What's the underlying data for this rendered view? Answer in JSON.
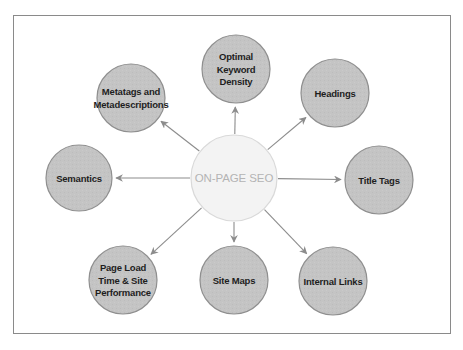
{
  "diagram": {
    "title": "ON-PAGE SEO",
    "center": {
      "label": "ON-PAGE SEO",
      "fill": "#f3f3f3",
      "stroke": "#d9d9d9",
      "text_color": "#b4b4b4"
    },
    "node_style": {
      "fill": "#c4c4c4",
      "stroke": "#8f8f8f",
      "text_color": "#1e1e1e"
    },
    "arrow_color": "#8c8c8c",
    "frame_color": "#8a8a8a",
    "nodes": [
      {
        "id": "optimal-keyword-density",
        "lines": [
          "Optimal",
          "Keyword",
          "Density"
        ],
        "direction": "top"
      },
      {
        "id": "headings",
        "lines": [
          "Headings"
        ],
        "direction": "top-right"
      },
      {
        "id": "title-tags",
        "lines": [
          "Title Tags"
        ],
        "direction": "right"
      },
      {
        "id": "internal-links",
        "lines": [
          "Internal Links"
        ],
        "direction": "bottom-right"
      },
      {
        "id": "site-maps",
        "lines": [
          "Site Maps"
        ],
        "direction": "bottom"
      },
      {
        "id": "page-load-time",
        "lines": [
          "Page Load",
          "Time & Site",
          "Performance"
        ],
        "direction": "bottom-left"
      },
      {
        "id": "semantics",
        "lines": [
          "Semantics"
        ],
        "direction": "left"
      },
      {
        "id": "metatags",
        "lines": [
          "Metatags and",
          "Metadescriptions"
        ],
        "direction": "top-left"
      }
    ],
    "edges": [
      {
        "from": "center",
        "to": "optimal-keyword-density"
      },
      {
        "from": "center",
        "to": "headings"
      },
      {
        "from": "center",
        "to": "title-tags"
      },
      {
        "from": "center",
        "to": "internal-links"
      },
      {
        "from": "center",
        "to": "site-maps"
      },
      {
        "from": "center",
        "to": "page-load-time"
      },
      {
        "from": "center",
        "to": "semantics"
      },
      {
        "from": "center",
        "to": "metatags"
      }
    ]
  }
}
